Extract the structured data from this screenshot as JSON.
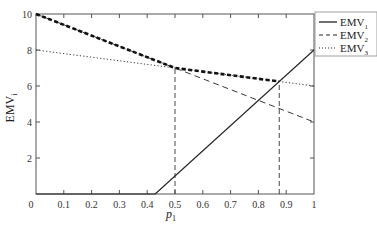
{
  "chart_data": {
    "type": "line",
    "title": "",
    "xlabel": "p1",
    "xlabel_main": "p",
    "xlabel_sub": "1",
    "ylabel": "EMVi",
    "ylabel_main": "EMV",
    "ylabel_sub": "i",
    "xlim": [
      0,
      1
    ],
    "ylim": [
      0,
      10
    ],
    "x_ticks": [
      "0",
      "0.1",
      "0.2",
      "0.3",
      "0.4",
      "0.5",
      "0.6",
      "0.7",
      "0.8",
      "0.9",
      "1"
    ],
    "y_ticks": [
      "2",
      "4",
      "6",
      "8",
      "10"
    ],
    "grid": false,
    "legend_position": "outside-top-right",
    "series": [
      {
        "name": "EMV1",
        "label_main": "EMV",
        "label_sub": "1",
        "style": "solid",
        "x": [
          0.4286,
          1.0
        ],
        "values": [
          0,
          8
        ],
        "note": "clipped at 0 for p < 0.43"
      },
      {
        "name": "EMV2",
        "label_main": "EMV",
        "label_sub": "2",
        "style": "dashed",
        "x": [
          0,
          1
        ],
        "values": [
          10,
          4
        ]
      },
      {
        "name": "EMV3",
        "label_main": "EMV",
        "label_sub": "3",
        "style": "dotted",
        "x": [
          0,
          1
        ],
        "values": [
          8,
          6
        ]
      }
    ],
    "upper_envelope": {
      "style": "thick-dashed",
      "x": [
        0,
        0.5,
        0.875
      ],
      "values": [
        10,
        7,
        6.25
      ]
    },
    "reference_lines": [
      {
        "orientation": "vertical",
        "x": 0.5,
        "from_y": 0,
        "to_y": 7,
        "style": "dashed"
      },
      {
        "orientation": "vertical",
        "x": 0.875,
        "from_y": 0,
        "to_y": 6.25,
        "style": "dashed"
      }
    ]
  }
}
